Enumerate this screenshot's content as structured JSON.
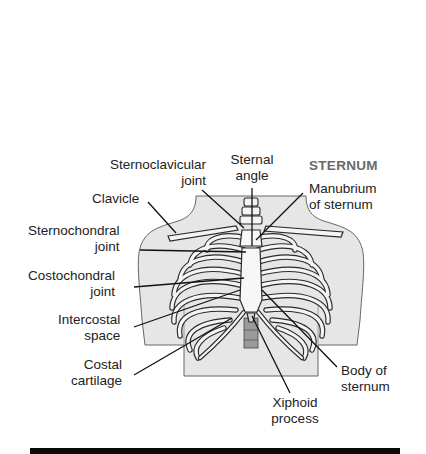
{
  "diagram": {
    "title": "STERNUM",
    "colors": {
      "skin": "#e6e6e6",
      "outline": "#555555",
      "bone": "#f2f2f2",
      "bone_outline": "#2a2a2a",
      "leader": "#111111",
      "title": "#6a6a6a",
      "rule": "#0a0a0a"
    },
    "labels": {
      "sternoclavicular_joint": {
        "line1": "Sternoclavicular",
        "line2": "joint"
      },
      "clavicle": {
        "line1": "Clavicle"
      },
      "sternochondral_joint": {
        "line1": "Sternochondral",
        "line2": "joint"
      },
      "costochondral_joint": {
        "line1": "Costochondral",
        "line2": "joint"
      },
      "intercostal_space": {
        "line1": "Intercostal",
        "line2": "space"
      },
      "costal_cartilage": {
        "line1": "Costal",
        "line2": "cartilage"
      },
      "sternal_angle": {
        "line1": "Sternal",
        "line2": "angle"
      },
      "manubrium": {
        "line1": "Manubrium",
        "line2": "of sternum"
      },
      "body_of_sternum": {
        "line1": "Body of",
        "line2": "sternum"
      },
      "xiphoid_process": {
        "line1": "Xiphoid",
        "line2": "process"
      }
    }
  }
}
